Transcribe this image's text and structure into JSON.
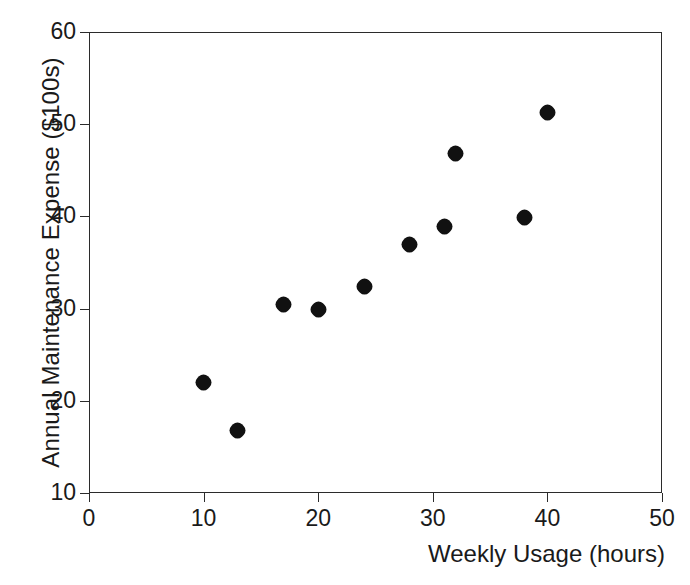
{
  "chart_data": {
    "type": "scatter",
    "title": "",
    "xlabel": "Weekly Usage (hours)",
    "ylabel": "Annual Maintenance Expense ($100s)",
    "xlim": [
      0,
      50
    ],
    "ylim": [
      10,
      60
    ],
    "xticks": [
      0,
      10,
      20,
      30,
      40,
      50
    ],
    "yticks": [
      10,
      20,
      30,
      40,
      50,
      60
    ],
    "xtick_labels": [
      "0",
      "10",
      "20",
      "30",
      "40",
      "50"
    ],
    "ytick_labels": [
      "10",
      "20",
      "30",
      "40",
      "50",
      "60"
    ],
    "grid": false,
    "legend": null,
    "marker": {
      "shape": "filled-circle",
      "color": "#111111",
      "size_px": 15
    },
    "x": [
      10,
      13,
      17,
      20,
      24,
      28,
      31,
      32,
      38,
      40
    ],
    "y": [
      22.0,
      16.8,
      30.4,
      29.9,
      32.4,
      36.9,
      38.9,
      46.8,
      39.9,
      51.3
    ],
    "points": [
      {
        "x": 10,
        "y": 22.0
      },
      {
        "x": 13,
        "y": 16.8
      },
      {
        "x": 17,
        "y": 30.4
      },
      {
        "x": 20,
        "y": 29.9
      },
      {
        "x": 24,
        "y": 32.4
      },
      {
        "x": 28,
        "y": 36.9
      },
      {
        "x": 31,
        "y": 38.9
      },
      {
        "x": 32,
        "y": 46.8
      },
      {
        "x": 38,
        "y": 39.9
      },
      {
        "x": 40,
        "y": 51.3
      }
    ],
    "series": [
      {
        "name": "Maintenance vs Usage",
        "x": [
          10,
          13,
          17,
          20,
          24,
          28,
          31,
          32,
          38,
          40
        ],
        "values": [
          22.0,
          16.8,
          30.4,
          29.9,
          32.4,
          36.9,
          38.9,
          46.8,
          39.9,
          51.3
        ]
      }
    ],
    "colors": {
      "marker": "#111111",
      "axis": "#2b2b2b",
      "text": "#1a1a1a",
      "background": "#ffffff"
    }
  }
}
